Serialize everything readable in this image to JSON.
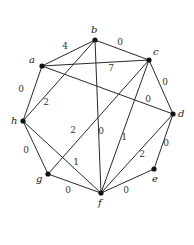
{
  "diagram": {
    "type": "weighted-graph",
    "nodes": [
      {
        "id": "a",
        "label": "a",
        "x": 42,
        "y": 66,
        "lx": 29,
        "ly": 63
      },
      {
        "id": "b",
        "label": "b",
        "x": 95,
        "y": 40,
        "lx": 91,
        "ly": 33
      },
      {
        "id": "c",
        "label": "c",
        "x": 149,
        "y": 60,
        "lx": 153,
        "ly": 55
      },
      {
        "id": "d",
        "label": "d",
        "x": 173,
        "y": 114,
        "lx": 178,
        "ly": 117
      },
      {
        "id": "e",
        "label": "e",
        "x": 154,
        "y": 169,
        "lx": 152,
        "ly": 182
      },
      {
        "id": "f",
        "label": "f",
        "x": 101,
        "y": 193,
        "lx": 98,
        "ly": 206
      },
      {
        "id": "g",
        "label": "g",
        "x": 48,
        "y": 174,
        "lx": 36,
        "ly": 182
      },
      {
        "id": "h",
        "label": "h",
        "x": 23,
        "y": 121,
        "lx": 11,
        "ly": 124
      }
    ],
    "edges": [
      {
        "from": "a",
        "to": "b",
        "weight": "4",
        "wx": 65,
        "wy": 49
      },
      {
        "from": "b",
        "to": "c",
        "weight": "0",
        "wx": 120,
        "wy": 45
      },
      {
        "from": "a",
        "to": "c",
        "weight": "7",
        "wx": 111,
        "wy": 71
      },
      {
        "from": "a",
        "to": "d",
        "weight": "0",
        "wx": 148,
        "wy": 102
      },
      {
        "from": "a",
        "to": "h",
        "weight": "0",
        "wx": 21,
        "wy": 92
      },
      {
        "from": "b",
        "to": "h",
        "weight": "2",
        "wx": 46,
        "wy": 105
      },
      {
        "from": "b",
        "to": "f",
        "weight": "0",
        "wx": 101,
        "wy": 134
      },
      {
        "from": "c",
        "to": "d",
        "weight": "0",
        "wx": 165,
        "wy": 85
      },
      {
        "from": "c",
        "to": "g",
        "weight": "2",
        "wx": 73,
        "wy": 133
      },
      {
        "from": "c",
        "to": "f",
        "weight": "1",
        "wx": 124,
        "wy": 140
      },
      {
        "from": "d",
        "to": "f",
        "weight": "2",
        "wx": 142,
        "wy": 157
      },
      {
        "from": "d",
        "to": "e",
        "weight": "0",
        "wx": 166,
        "wy": 146
      },
      {
        "from": "h",
        "to": "g",
        "weight": "0",
        "wx": 26,
        "wy": 153
      },
      {
        "from": "h",
        "to": "f",
        "weight": "1",
        "wx": 76,
        "wy": 165
      },
      {
        "from": "g",
        "to": "f",
        "weight": "0",
        "wx": 68,
        "wy": 193
      },
      {
        "from": "e",
        "to": "f",
        "weight": "0",
        "wx": 126,
        "wy": 193
      }
    ]
  }
}
